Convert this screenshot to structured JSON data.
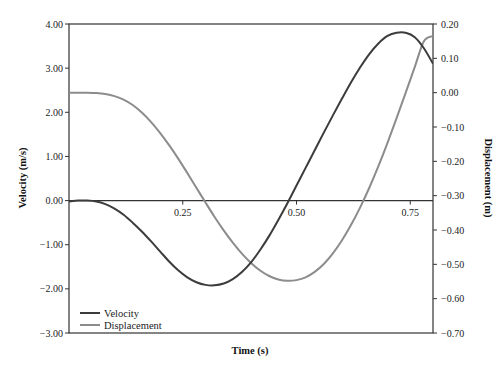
{
  "chart_data": {
    "type": "line",
    "title": "",
    "xlabel": "Time (s)",
    "ylabel": "Velocity (m/s)",
    "y2label": "Displacement (m)",
    "xlim": [
      0,
      0.8
    ],
    "ylim": [
      -3.0,
      4.0
    ],
    "y2lim": [
      -0.7,
      0.2
    ],
    "x_ticks": [
      0.25,
      0.5,
      0.75
    ],
    "x_tick_labels": [
      "0.25",
      "0.50",
      "0.75"
    ],
    "y_ticks": [
      4,
      3,
      2,
      1,
      0,
      -1,
      -2,
      -3
    ],
    "y_tick_labels": [
      "4.00",
      "3.00",
      "2.00",
      "1.00",
      "0.00",
      "-1.00",
      "-2.00",
      "-3.00"
    ],
    "y2_ticks": [
      0.2,
      0.1,
      0.0,
      -0.1,
      -0.2,
      -0.3,
      -0.4,
      -0.5,
      -0.6,
      -0.7
    ],
    "y2_tick_labels": [
      "0.20",
      "0.10",
      "0.00",
      "-0.10",
      "-0.20",
      "-0.30",
      "-0.40",
      "-0.50",
      "-0.60",
      "-0.70"
    ],
    "grid": false,
    "legend_position": "lower left",
    "series": [
      {
        "name": "Velocity",
        "axis": "left",
        "color": "#3c3c3c",
        "x": [
          0.0,
          0.02,
          0.04,
          0.06,
          0.08,
          0.1,
          0.12,
          0.14,
          0.16,
          0.18,
          0.2,
          0.22,
          0.24,
          0.26,
          0.28,
          0.3,
          0.32,
          0.34,
          0.36,
          0.38,
          0.4,
          0.42,
          0.44,
          0.46,
          0.48,
          0.5,
          0.52,
          0.54,
          0.56,
          0.58,
          0.6,
          0.62,
          0.64,
          0.66,
          0.68,
          0.7,
          0.72,
          0.74,
          0.76,
          0.78,
          0.8
        ],
        "values": [
          -0.02,
          0.0,
          0.0,
          -0.02,
          -0.08,
          -0.18,
          -0.32,
          -0.5,
          -0.7,
          -0.92,
          -1.15,
          -1.38,
          -1.58,
          -1.74,
          -1.85,
          -1.91,
          -1.92,
          -1.88,
          -1.78,
          -1.62,
          -1.4,
          -1.12,
          -0.8,
          -0.44,
          -0.06,
          0.34,
          0.74,
          1.14,
          1.54,
          1.93,
          2.31,
          2.68,
          3.02,
          3.32,
          3.56,
          3.73,
          3.8,
          3.8,
          3.7,
          3.45,
          3.1
        ]
      },
      {
        "name": "Displacement",
        "axis": "right",
        "color": "#8c8c8c",
        "x": [
          0.0,
          0.02,
          0.04,
          0.06,
          0.08,
          0.1,
          0.12,
          0.14,
          0.16,
          0.18,
          0.2,
          0.22,
          0.24,
          0.26,
          0.28,
          0.3,
          0.32,
          0.34,
          0.36,
          0.38,
          0.4,
          0.42,
          0.44,
          0.46,
          0.48,
          0.5,
          0.52,
          0.54,
          0.56,
          0.58,
          0.6,
          0.62,
          0.64,
          0.66,
          0.68,
          0.7,
          0.72,
          0.74,
          0.76,
          0.78,
          0.8
        ],
        "values": [
          0.0,
          0.0,
          0.0,
          -0.001,
          -0.004,
          -0.01,
          -0.02,
          -0.036,
          -0.058,
          -0.085,
          -0.117,
          -0.153,
          -0.192,
          -0.234,
          -0.277,
          -0.32,
          -0.362,
          -0.401,
          -0.437,
          -0.469,
          -0.496,
          -0.518,
          -0.534,
          -0.544,
          -0.548,
          -0.546,
          -0.538,
          -0.522,
          -0.499,
          -0.468,
          -0.43,
          -0.385,
          -0.334,
          -0.277,
          -0.214,
          -0.146,
          -0.074,
          0.0,
          0.075,
          0.15,
          0.165
        ]
      }
    ]
  },
  "legend": {
    "items": [
      {
        "label": "Velocity",
        "color": "#3c3c3c"
      },
      {
        "label": "Displacement",
        "color": "#8c8c8c"
      }
    ]
  },
  "axes": {
    "x_title": "Time (s)",
    "y_left_title": "Velocity (m/s)",
    "y_right_title": "Displacement (m)"
  }
}
